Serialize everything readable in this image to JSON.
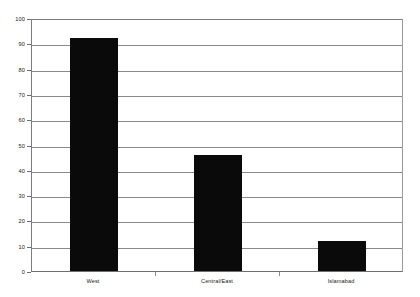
{
  "chart_data": {
    "type": "bar",
    "title": "",
    "subtitle": "",
    "xlabel": "",
    "ylabel": "",
    "categories": [
      "West",
      "Central/East",
      "Islamabad"
    ],
    "values": [
      92,
      46,
      12
    ],
    "ylim": [
      0,
      100
    ],
    "ytick_step": 10,
    "yticks": [
      100,
      90,
      80,
      70,
      60,
      50,
      40,
      30,
      20,
      10,
      0
    ],
    "ytick_labels": [
      "100",
      "90",
      "80",
      "70",
      "60",
      "50",
      "40",
      "30",
      "20",
      "10",
      "0"
    ],
    "grid": {
      "horizontal": true,
      "vertical": false,
      "color": "#8a8a8a"
    },
    "legend": {
      "visible": false,
      "position": "none",
      "entries": []
    },
    "series": [
      {
        "name": "",
        "color": "#0a0a0a",
        "values": [
          92,
          46,
          12
        ]
      }
    ],
    "annotations": [],
    "plot_frame": {
      "border": true,
      "border_color": "#7d7d7d",
      "background": "#ffffff"
    }
  }
}
